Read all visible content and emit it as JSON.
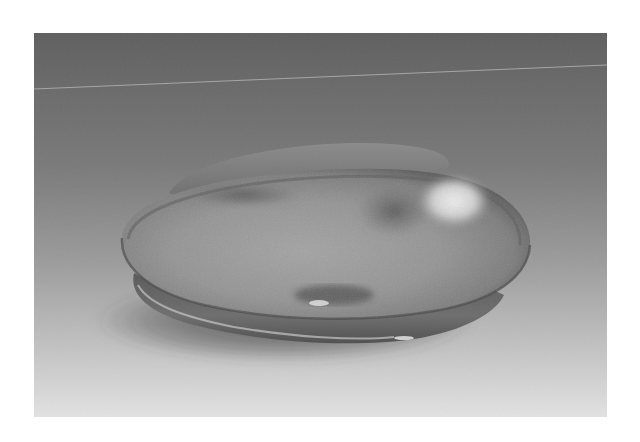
{
  "image": {
    "subject": "corroded metal dish artifact",
    "description": "Grayscale photograph of an ancient shallow metal dish with a flat flanged base resting on a studio gradient backdrop",
    "colors": {
      "page_background": "#ffffff",
      "backdrop_top": "#5f5f5f",
      "backdrop_mid": "#8e8e8e",
      "backdrop_bottom": "#e2e2e2",
      "horizon_line": "#b5b5b5",
      "dish_dark": "#4a4a4a",
      "dish_mid": "#8a8a8a",
      "dish_light": "#b0b0b0",
      "highlight": "#e8e8e8",
      "shadow": "#3a3a3a"
    }
  }
}
